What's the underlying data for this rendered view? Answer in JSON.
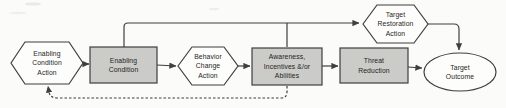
{
  "diagram_title": "Results chain diagram",
  "colors": {
    "background": "#fbfbf9",
    "box_fill": "#cbcbc8",
    "shape_fill": "#fdfdfb",
    "stroke": "#3f3f3f",
    "connector": "#3f3f3f",
    "text": "#1e1e1e"
  },
  "nodes": {
    "enabling_condition_action": {
      "label": "Enabling\nCondition\nAction",
      "shape": "hexagon"
    },
    "enabling_condition": {
      "label": "Enabling\nCondition",
      "shape": "rect"
    },
    "behavior_change_action": {
      "label": "Behavior\nChange\nAction",
      "shape": "hexagon"
    },
    "awareness_incentives_abilities": {
      "label": "Awareness,\nIncentives &/or\nAbilities",
      "shape": "rect"
    },
    "threat_reduction": {
      "label": "Threat\nReduction",
      "shape": "rect"
    },
    "target_restoration_action": {
      "label": "Target\nRestoration\nAction",
      "shape": "hexagon"
    },
    "target_outcome": {
      "label": "Target\nOutcome",
      "shape": "ellipse"
    }
  },
  "edges": [
    {
      "from": "enabling_condition_action",
      "to": "enabling_condition",
      "style": "solid"
    },
    {
      "from": "enabling_condition",
      "to": "behavior_change_action",
      "style": "solid"
    },
    {
      "from": "behavior_change_action",
      "to": "awareness_incentives_abilities",
      "style": "solid"
    },
    {
      "from": "awareness_incentives_abilities",
      "to": "threat_reduction",
      "style": "solid"
    },
    {
      "from": "threat_reduction",
      "to": "target_outcome",
      "style": "solid"
    },
    {
      "from": "enabling_condition",
      "to": "target_restoration_action",
      "style": "solid"
    },
    {
      "from": "awareness_incentives_abilities",
      "to": "target_restoration_action",
      "style": "solid"
    },
    {
      "from": "target_restoration_action",
      "to": "target_outcome",
      "style": "solid"
    },
    {
      "from": "awareness_incentives_abilities",
      "to": "enabling_condition_action",
      "style": "dashed"
    }
  ]
}
